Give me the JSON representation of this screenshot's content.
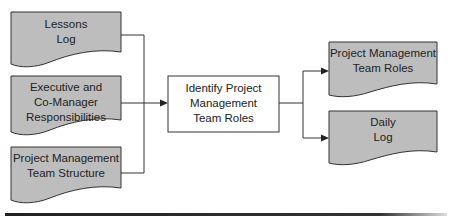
{
  "colors": {
    "doc_fill": "#bdbdbd",
    "process_fill": "#ffffff",
    "stroke": "#333333",
    "bottom_rule": "#222222"
  },
  "inputs": [
    {
      "id": "lessons-log",
      "lines": [
        "Lessons",
        "Log"
      ]
    },
    {
      "id": "executive-co-manager-responsibilities",
      "lines": [
        "Executive and",
        "Co-Manager",
        "Responsibilities"
      ]
    },
    {
      "id": "project-management-team-structure",
      "lines": [
        "Project Management",
        "Team Structure"
      ]
    }
  ],
  "process": {
    "id": "identify-project-management-team-roles",
    "lines": [
      "Identify Project",
      "Management",
      "Team Roles"
    ]
  },
  "outputs": [
    {
      "id": "project-management-team-roles",
      "lines": [
        "Project Management",
        "Team Roles"
      ]
    },
    {
      "id": "daily-log",
      "lines": [
        "Daily",
        "Log"
      ]
    }
  ]
}
